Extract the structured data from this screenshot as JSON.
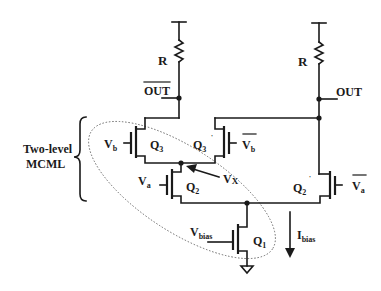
{
  "diagram": {
    "type": "circuit-schematic",
    "group_label": {
      "line1": "Two-level",
      "line2": "MCML"
    },
    "resistors": [
      {
        "id": "R_left",
        "label": "R"
      },
      {
        "id": "R_right",
        "label": "R"
      }
    ],
    "outputs": {
      "left": {
        "label": "OUT",
        "overbar": true
      },
      "right": {
        "label": "OUT",
        "overbar": false
      }
    },
    "transistors": [
      {
        "id": "Q3",
        "label": "Q",
        "sub": "3",
        "prime": false,
        "gate": {
          "label": "V",
          "sub": "b",
          "overbar": false
        }
      },
      {
        "id": "Q3p",
        "label": "Q",
        "sub": "3",
        "prime": true,
        "gate": {
          "label": "V",
          "sub": "b",
          "overbar": true
        }
      },
      {
        "id": "Q2",
        "label": "Q",
        "sub": "2",
        "prime": false,
        "gate": {
          "label": "V",
          "sub": "a",
          "overbar": false
        }
      },
      {
        "id": "Q2p",
        "label": "Q",
        "sub": "2",
        "prime": true,
        "gate": {
          "label": "V",
          "sub": "a",
          "overbar": true
        }
      },
      {
        "id": "Q1",
        "label": "Q",
        "sub": "1",
        "prime": false,
        "gate": {
          "label": "V",
          "sub": "bias",
          "overbar": false
        }
      }
    ],
    "annotations": {
      "vx": {
        "label": "V",
        "sub": "X"
      },
      "current": {
        "label": "I",
        "sub": "bias"
      }
    },
    "prime_mark": "'",
    "colors": {
      "ink": "#1a1a1a",
      "ellipse": "#666666",
      "background": "#ffffff"
    }
  }
}
